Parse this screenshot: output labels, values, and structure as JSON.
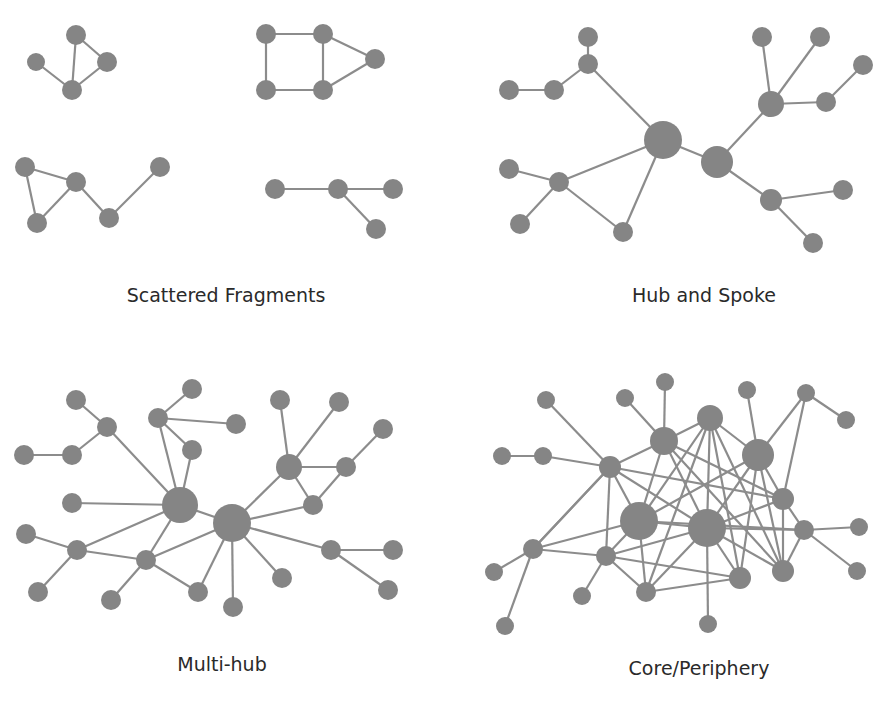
{
  "figure": {
    "node_color": "#858585",
    "edge_color": "#8c8c8c",
    "background": "#ffffff"
  },
  "panels": [
    {
      "id": "scattered",
      "label": "Scattered Fragments",
      "label_pos": [
        226,
        296
      ],
      "nodes": [
        [
          76,
          35,
          10
        ],
        [
          36,
          62,
          9
        ],
        [
          107,
          62,
          10
        ],
        [
          72,
          90,
          10
        ],
        [
          266,
          34,
          10
        ],
        [
          323,
          34,
          10
        ],
        [
          375,
          59,
          10
        ],
        [
          266,
          90,
          10
        ],
        [
          323,
          90,
          10
        ],
        [
          25,
          167,
          10
        ],
        [
          76,
          182,
          10
        ],
        [
          37,
          223,
          10
        ],
        [
          109,
          218,
          10
        ],
        [
          160,
          167,
          10
        ],
        [
          275,
          189,
          10
        ],
        [
          338,
          189,
          10
        ],
        [
          393,
          189,
          10
        ],
        [
          376,
          229,
          10
        ]
      ],
      "edges": [
        [
          0,
          3
        ],
        [
          0,
          2
        ],
        [
          1,
          3
        ],
        [
          2,
          3
        ],
        [
          4,
          5
        ],
        [
          4,
          7
        ],
        [
          5,
          8
        ],
        [
          7,
          8
        ],
        [
          5,
          6
        ],
        [
          8,
          6
        ],
        [
          9,
          10
        ],
        [
          9,
          11
        ],
        [
          11,
          10
        ],
        [
          10,
          12
        ],
        [
          12,
          13
        ],
        [
          14,
          15
        ],
        [
          15,
          16
        ],
        [
          15,
          17
        ]
      ]
    },
    {
      "id": "hub-spoke",
      "label": "Hub and Spoke",
      "label_pos": [
        704,
        296
      ],
      "nodes": [
        [
          663,
          140,
          19
        ],
        [
          717,
          162,
          16
        ],
        [
          588,
          37,
          10
        ],
        [
          588,
          64,
          10
        ],
        [
          509,
          90,
          10
        ],
        [
          554,
          90,
          10
        ],
        [
          509,
          169,
          10
        ],
        [
          559,
          182,
          10
        ],
        [
          520,
          224,
          10
        ],
        [
          623,
          232,
          10
        ],
        [
          762,
          37,
          10
        ],
        [
          820,
          37,
          10
        ],
        [
          863,
          65,
          10
        ],
        [
          771,
          104,
          13
        ],
        [
          826,
          102,
          10
        ],
        [
          771,
          200,
          11
        ],
        [
          843,
          190,
          10
        ],
        [
          813,
          243,
          10
        ]
      ],
      "edges": [
        [
          0,
          1
        ],
        [
          0,
          3
        ],
        [
          3,
          2
        ],
        [
          3,
          5
        ],
        [
          5,
          4
        ],
        [
          0,
          7
        ],
        [
          7,
          6
        ],
        [
          7,
          8
        ],
        [
          7,
          9
        ],
        [
          0,
          9
        ],
        [
          1,
          13
        ],
        [
          13,
          10
        ],
        [
          13,
          11
        ],
        [
          13,
          14
        ],
        [
          14,
          12
        ],
        [
          1,
          15
        ],
        [
          15,
          16
        ],
        [
          15,
          17
        ]
      ]
    },
    {
      "id": "multi-hub",
      "label": "Multi-hub",
      "label_pos": [
        222,
        665
      ],
      "nodes": [
        [
          180,
          505,
          18
        ],
        [
          232,
          523,
          19
        ],
        [
          76,
          400,
          10
        ],
        [
          107,
          427,
          10
        ],
        [
          24,
          455,
          10
        ],
        [
          72,
          455,
          10
        ],
        [
          192,
          389,
          10
        ],
        [
          158,
          418,
          10
        ],
        [
          236,
          424,
          10
        ],
        [
          192,
          450,
          10
        ],
        [
          72,
          503,
          10
        ],
        [
          26,
          534,
          10
        ],
        [
          77,
          550,
          10
        ],
        [
          38,
          592,
          10
        ],
        [
          146,
          560,
          10
        ],
        [
          111,
          600,
          10
        ],
        [
          198,
          592,
          10
        ],
        [
          233,
          607,
          10
        ],
        [
          280,
          400,
          10
        ],
        [
          339,
          402,
          10
        ],
        [
          289,
          467,
          13
        ],
        [
          346,
          467,
          10
        ],
        [
          383,
          429,
          10
        ],
        [
          313,
          505,
          10
        ],
        [
          331,
          550,
          10
        ],
        [
          393,
          550,
          10
        ],
        [
          388,
          590,
          10
        ],
        [
          282,
          578,
          10
        ]
      ],
      "edges": [
        [
          0,
          1
        ],
        [
          0,
          7
        ],
        [
          7,
          6
        ],
        [
          7,
          8
        ],
        [
          7,
          9
        ],
        [
          0,
          9
        ],
        [
          0,
          3
        ],
        [
          3,
          2
        ],
        [
          3,
          5
        ],
        [
          5,
          4
        ],
        [
          0,
          10
        ],
        [
          0,
          12
        ],
        [
          12,
          11
        ],
        [
          12,
          13
        ],
        [
          12,
          14
        ],
        [
          0,
          14
        ],
        [
          14,
          15
        ],
        [
          14,
          16
        ],
        [
          1,
          14
        ],
        [
          1,
          16
        ],
        [
          1,
          17
        ],
        [
          1,
          20
        ],
        [
          20,
          18
        ],
        [
          20,
          19
        ],
        [
          20,
          21
        ],
        [
          21,
          22
        ],
        [
          20,
          23
        ],
        [
          21,
          23
        ],
        [
          1,
          23
        ],
        [
          1,
          24
        ],
        [
          24,
          25
        ],
        [
          24,
          26
        ],
        [
          1,
          27
        ]
      ]
    },
    {
      "id": "core-periphery",
      "label": "Core/Periphery",
      "label_pos": [
        699,
        670
      ],
      "nodes": [
        [
          639,
          521,
          19
        ],
        [
          707,
          528,
          19
        ],
        [
          664,
          441,
          14
        ],
        [
          710,
          418,
          13
        ],
        [
          758,
          455,
          16
        ],
        [
          610,
          467,
          11
        ],
        [
          546,
          400,
          9
        ],
        [
          625,
          398,
          9
        ],
        [
          665,
          382,
          9
        ],
        [
          747,
          390,
          9
        ],
        [
          806,
          393,
          9
        ],
        [
          846,
          420,
          9
        ],
        [
          502,
          456,
          9
        ],
        [
          543,
          456,
          9
        ],
        [
          783,
          499,
          11
        ],
        [
          804,
          530,
          10
        ],
        [
          859,
          527,
          9
        ],
        [
          857,
          571,
          9
        ],
        [
          533,
          549,
          10
        ],
        [
          494,
          572,
          9
        ],
        [
          505,
          626,
          9
        ],
        [
          606,
          556,
          10
        ],
        [
          582,
          596,
          9
        ],
        [
          646,
          592,
          10
        ],
        [
          740,
          578,
          11
        ],
        [
          783,
          571,
          11
        ],
        [
          708,
          624,
          9
        ]
      ],
      "edges": [
        [
          0,
          1
        ],
        [
          0,
          2
        ],
        [
          0,
          3
        ],
        [
          0,
          4
        ],
        [
          0,
          5
        ],
        [
          0,
          18
        ],
        [
          0,
          21
        ],
        [
          0,
          23
        ],
        [
          0,
          15
        ],
        [
          1,
          2
        ],
        [
          1,
          3
        ],
        [
          1,
          4
        ],
        [
          1,
          5
        ],
        [
          1,
          14
        ],
        [
          1,
          15
        ],
        [
          1,
          21
        ],
        [
          1,
          23
        ],
        [
          1,
          24
        ],
        [
          1,
          25
        ],
        [
          1,
          26
        ],
        [
          2,
          3
        ],
        [
          2,
          5
        ],
        [
          2,
          8
        ],
        [
          2,
          7
        ],
        [
          2,
          14
        ],
        [
          2,
          25
        ],
        [
          3,
          4
        ],
        [
          3,
          25
        ],
        [
          3,
          24
        ],
        [
          3,
          23
        ],
        [
          4,
          9
        ],
        [
          4,
          10
        ],
        [
          10,
          11
        ],
        [
          4,
          14
        ],
        [
          4,
          25
        ],
        [
          4,
          24
        ],
        [
          5,
          6
        ],
        [
          5,
          13
        ],
        [
          13,
          12
        ],
        [
          5,
          18
        ],
        [
          5,
          21
        ],
        [
          5,
          14
        ],
        [
          14,
          10
        ],
        [
          14,
          15
        ],
        [
          14,
          25
        ],
        [
          15,
          16
        ],
        [
          15,
          17
        ],
        [
          15,
          25
        ],
        [
          18,
          19
        ],
        [
          18,
          20
        ],
        [
          18,
          21
        ],
        [
          18,
          5
        ],
        [
          21,
          22
        ],
        [
          21,
          23
        ],
        [
          21,
          24
        ],
        [
          23,
          24
        ]
      ]
    }
  ]
}
